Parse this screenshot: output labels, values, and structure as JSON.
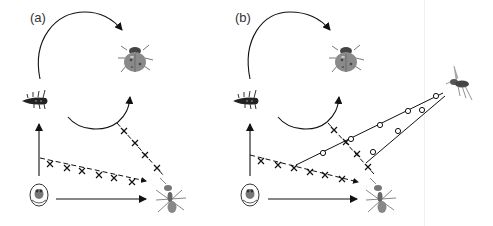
{
  "figure": {
    "panels": [
      {
        "label": "(a)",
        "organisms": [
          "ladybird-larva",
          "ladybird-adult",
          "aphid-in-mummy",
          "ant"
        ],
        "links": [
          {
            "from": "ladybird-larva",
            "to": "ladybird-adult",
            "style": "solid-curved-arrow",
            "meaning": "development"
          },
          {
            "from": "ladybird-adult",
            "to": "ladybird-larva",
            "style": "solid-curved-arrow",
            "meaning": "reproduction"
          },
          {
            "from": "aphid-in-mummy",
            "to": "ladybird-larva",
            "style": "solid-arrow"
          },
          {
            "from": "aphid-in-mummy",
            "to": "ant",
            "style": "solid-arrow"
          },
          {
            "from": "ladybird-larva",
            "to": "ant",
            "style": "dashed-crossed"
          },
          {
            "from": "ladybird-adult",
            "to": "ant",
            "style": "dashed-crossed"
          }
        ]
      },
      {
        "label": "(b)",
        "organisms": [
          "ladybird-larva",
          "ladybird-adult",
          "aphid-in-mummy",
          "ant",
          "parasitoid-wasp"
        ],
        "links": [
          {
            "from": "ladybird-larva",
            "to": "ladybird-adult",
            "style": "solid-curved-arrow"
          },
          {
            "from": "ladybird-adult",
            "to": "ladybird-larva",
            "style": "solid-curved-arrow"
          },
          {
            "from": "aphid-in-mummy",
            "to": "ladybird-larva",
            "style": "solid-arrow"
          },
          {
            "from": "aphid-in-mummy",
            "to": "ant",
            "style": "solid-arrow"
          },
          {
            "from": "ladybird-larva",
            "to": "ant",
            "style": "dashed-crossed"
          },
          {
            "from": "ladybird-adult",
            "to": "ant",
            "style": "dashed-crossed"
          },
          {
            "from": "parasitoid-wasp",
            "to": "larva-ant-link",
            "style": "solid-circles"
          },
          {
            "from": "parasitoid-wasp",
            "to": "adult-ant-link",
            "style": "solid-circles"
          }
        ]
      }
    ]
  }
}
